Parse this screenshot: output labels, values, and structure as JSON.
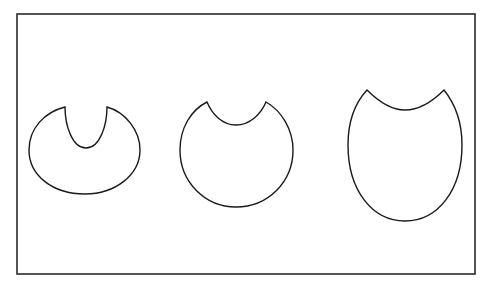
{
  "diagram": {
    "title": "",
    "background": "#ffffff",
    "stroke_color": "#1a1a1a",
    "frame": {
      "x": 17,
      "y": 14,
      "width": 458,
      "height": 260
    },
    "shapes": [
      {
        "name": "wide-oval-with-deep-u-notch",
        "description": "Horizontally wide ellipse with a deep U-shaped notch cut from the top",
        "notch_left_tip": [
          65,
          107
        ],
        "notch_right_tip": [
          107,
          107
        ],
        "notch_bottom": [
          86,
          148
        ],
        "outer_bounds": {
          "left": 29,
          "right": 140,
          "top": 107,
          "bottom": 194
        }
      },
      {
        "name": "circle-with-shallow-arc-notch",
        "description": "Near-circle with a shallow arc notch cut from the top",
        "notch_left_tip": [
          207,
          102
        ],
        "notch_right_tip": [
          266,
          102
        ],
        "notch_bottom": [
          236,
          125
        ],
        "outer_bounds": {
          "left": 180,
          "right": 293,
          "top": 102,
          "bottom": 207
        }
      },
      {
        "name": "tall-oval-with-wide-arc-notch",
        "description": "Vertically tall oval with a wide shallow arc notch cut from the top",
        "notch_left_tip": [
          367,
          90
        ],
        "notch_right_tip": [
          444,
          90
        ],
        "notch_bottom": [
          405,
          110
        ],
        "outer_bounds": {
          "left": 348,
          "right": 462,
          "top": 90,
          "bottom": 221
        }
      }
    ]
  }
}
